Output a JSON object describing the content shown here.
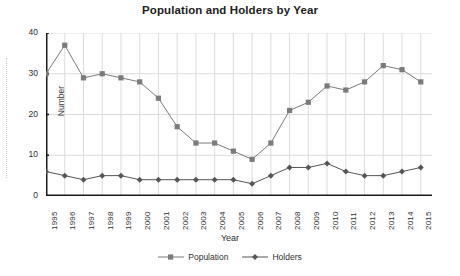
{
  "chart_data": {
    "type": "line",
    "title": "Population and Holders by Year",
    "xlabel": "Year",
    "ylabel": "Number",
    "categories": [
      "1995",
      "1996",
      "1997",
      "1998",
      "1999",
      "2000",
      "2001",
      "2002",
      "2003",
      "2004",
      "2005",
      "2006",
      "2007",
      "2008",
      "2009",
      "2010",
      "2011",
      "2012",
      "2013",
      "2014",
      "2015"
    ],
    "series": [
      {
        "name": "Population",
        "marker": "square",
        "color": "#7b7b7b",
        "values": [
          30,
          37,
          29,
          30,
          29,
          28,
          24,
          17,
          13,
          13,
          11,
          9,
          13,
          21,
          23,
          27,
          26,
          28,
          32,
          31,
          28
        ]
      },
      {
        "name": "Holders",
        "marker": "diamond",
        "color": "#555555",
        "values": [
          6,
          5,
          4,
          5,
          5,
          4,
          4,
          4,
          4,
          4,
          4,
          3,
          5,
          7,
          7,
          8,
          6,
          5,
          5,
          6,
          7
        ]
      }
    ],
    "ylim": [
      0,
      40
    ],
    "yticks": [
      0,
      10,
      20,
      30,
      40
    ],
    "xlim": [
      "1995",
      "2015"
    ],
    "grid": true,
    "grid_color": "#dcdcdc",
    "legend_position": "bottom",
    "axis_color": "#1a1a1a"
  }
}
